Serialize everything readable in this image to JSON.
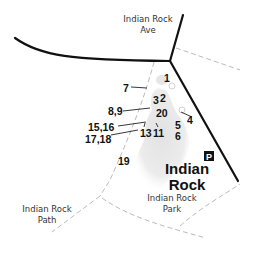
{
  "map": {
    "streets": [
      {
        "id": "indian-rock-ave",
        "lines": [
          "Indian Rock",
          "Ave"
        ]
      },
      {
        "id": "indian-rock-path",
        "lines": [
          "Indian Rock",
          "Path"
        ]
      },
      {
        "id": "indian-rock-park",
        "lines": [
          "Indian Rock",
          "Park"
        ]
      }
    ],
    "landmark": {
      "lines": [
        "Indian",
        "Rock"
      ]
    },
    "parking": {
      "symbol": "P"
    },
    "markers": [
      {
        "label": "1"
      },
      {
        "label": "2"
      },
      {
        "label": "3"
      },
      {
        "label": "4"
      },
      {
        "label": "5"
      },
      {
        "label": "6"
      },
      {
        "label": "7"
      },
      {
        "label": "8,9"
      },
      {
        "label": "11"
      },
      {
        "label": "13"
      },
      {
        "label": "15,16"
      },
      {
        "label": "17,18"
      },
      {
        "label": "19"
      },
      {
        "label": "20"
      }
    ],
    "colors": {
      "road": "#111111",
      "path": "#bbbbbb",
      "rock": "#d9d9d9",
      "parking_bg": "#111111"
    }
  }
}
